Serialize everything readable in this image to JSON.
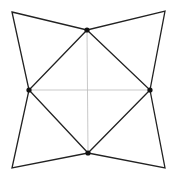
{
  "canvas": {
    "width": 172,
    "height": 178,
    "background": "#ffffff"
  },
  "colors": {
    "stroke": "#222222",
    "guide": "#bbbbbb",
    "dot": "#111111"
  },
  "outer_corners": {
    "top_left": [
      12,
      12
    ],
    "top_right": [
      165,
      11
    ],
    "bottom_right": [
      165,
      168
    ],
    "bottom_left": [
      12,
      168
    ]
  },
  "inner_points": {
    "top": [
      87,
      30
    ],
    "right": [
      150,
      90
    ],
    "bottom": [
      88,
      153
    ],
    "left": [
      29,
      90
    ]
  },
  "guides": [
    {
      "from": "top",
      "to": "bottom"
    },
    {
      "from": "left",
      "to": "right"
    }
  ]
}
